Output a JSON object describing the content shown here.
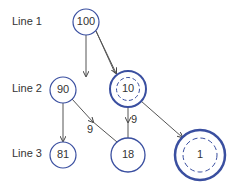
{
  "colors": {
    "node_stroke": "#3a4fa0",
    "edge": "#444444",
    "text": "#222222"
  },
  "row_labels": [
    "Line 1",
    "Line 2",
    "Line 3"
  ],
  "nodes": [
    {
      "id": "n100",
      "label": "100"
    },
    {
      "id": "n90",
      "label": "90"
    },
    {
      "id": "n81",
      "label": "81"
    },
    {
      "id": "n10",
      "label": "10"
    },
    {
      "id": "n18",
      "label": "18"
    },
    {
      "id": "n1",
      "label": "1"
    }
  ],
  "edges": [
    {
      "from": "100",
      "to": "90",
      "label": ""
    },
    {
      "from": "100",
      "to": "10",
      "label": ""
    },
    {
      "from": "90",
      "to": "81",
      "label": ""
    },
    {
      "from": "90",
      "to": "18",
      "label": "9"
    },
    {
      "from": "10",
      "to": "18",
      "label": "9"
    },
    {
      "from": "10",
      "to": "1",
      "label": ""
    }
  ]
}
